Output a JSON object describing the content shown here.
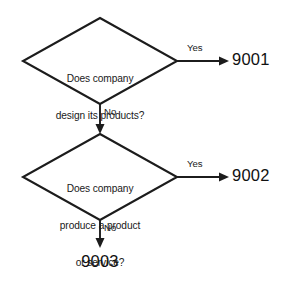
{
  "diagram": {
    "type": "flowchart",
    "background_color": "#ffffff",
    "line_color": "#1c1c1c",
    "text_color": "#1a1a1a",
    "nodes": [
      {
        "id": "decision_1",
        "shape": "diamond",
        "lines": [
          "Does company",
          "design its products?"
        ],
        "center_x": 100,
        "center_y": 61
      },
      {
        "id": "decision_2",
        "shape": "diamond",
        "lines": [
          "Does company",
          "produce a product",
          "or service?"
        ],
        "center_x": 100,
        "center_y": 177
      }
    ],
    "terminals": [
      {
        "id": "out_9001",
        "label": "9001",
        "x": 232,
        "y": 61
      },
      {
        "id": "out_9002",
        "label": "9002",
        "x": 232,
        "y": 177
      },
      {
        "id": "out_9003",
        "label": "9003",
        "x": 100,
        "y": 262
      }
    ],
    "edges": [
      {
        "id": "edge_1_yes",
        "from": "decision_1",
        "to": "out_9001",
        "label": "Yes",
        "direction": "right"
      },
      {
        "id": "edge_1_no",
        "from": "decision_1",
        "to": "decision_2",
        "label": "No",
        "direction": "down"
      },
      {
        "id": "edge_2_yes",
        "from": "decision_2",
        "to": "out_9002",
        "label": "Yes",
        "direction": "right"
      },
      {
        "id": "edge_2_no",
        "from": "decision_2",
        "to": "out_9003",
        "label": "No",
        "direction": "down"
      }
    ]
  }
}
